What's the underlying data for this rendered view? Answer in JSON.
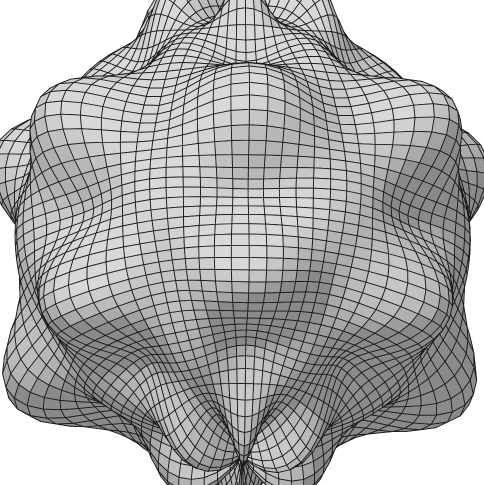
{
  "figure": {
    "title": "Spherical harmonic wireframe surface",
    "caption": "",
    "width": 484,
    "height": 485,
    "background_color": "#ffffff"
  },
  "chart_data": {
    "type": "surface",
    "title": "Spherical harmonic wireframe surface",
    "subtitle": "",
    "xlabel": "",
    "ylabel": "",
    "zlabel": "",
    "render_style": "wireframe-mesh-shaded",
    "axes_visible": false,
    "grid": true,
    "legend": null,
    "legend_position": "none",
    "annotations": [],
    "tick_labels": [],
    "colors": {
      "background": "#ffffff",
      "mesh_line": "#1a1a1a",
      "facet_light": "#d8d8d8",
      "facet_mid": "#a8a8a8",
      "facet_dark": "#4a4a4a",
      "silhouette": "#101010"
    },
    "surface_equation": {
      "form": "r(theta, phi) = r0 + a1*cos(m1*phi)*sin(n1*theta) + a2*sin(n2*theta) + a3*cos(m3*phi)",
      "r0": 1.0,
      "a1": 0.085,
      "m1": 6,
      "n1": 7,
      "a2": 0.072,
      "n2": 7,
      "a3": 0.03,
      "m3": 6
    },
    "mesh": {
      "u_divisions": 72,
      "v_divisions": 58,
      "u_range_deg": [
        0,
        360
      ],
      "v_range_deg": [
        0,
        180
      ],
      "line_width": 0.85
    },
    "camera": {
      "azimuth_deg": 28,
      "elevation_deg": 18,
      "roll_deg": 0,
      "projection": "perspective",
      "fov": 26,
      "distance": 5.4,
      "zoom": 1.0
    },
    "lighting": {
      "direction": [
        -0.35,
        -0.62,
        0.7
      ],
      "ambient": 0.34,
      "diffuse": 0.78,
      "specular": 0.0
    },
    "bounds_px": {
      "left": 8,
      "top": 8,
      "right": 476,
      "bottom": 478,
      "center_x": 242,
      "center_y": 243,
      "radius_x": 234,
      "radius_y": 235
    },
    "features": {
      "pole_position_px": [
        245,
        22
      ],
      "visible_ripple_bands": 4,
      "silhouette_lobes": 5,
      "meridian_wave_count": 6
    }
  }
}
